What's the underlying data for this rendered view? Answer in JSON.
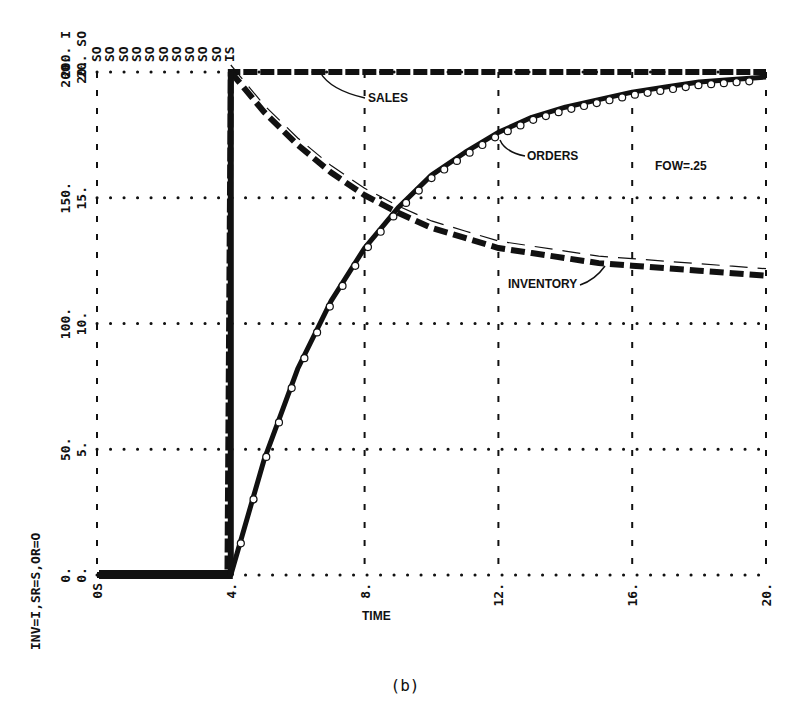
{
  "chart_data": {
    "type": "line",
    "title": "",
    "caption": "(b)",
    "xlabel": "TIME",
    "ylabel_left_rotated": "INV=I,SR=S,OR=O",
    "xlim": [
      0,
      20
    ],
    "ylim": [
      0,
      200
    ],
    "x_ticks": [
      "0S",
      "4.",
      "8.",
      "12.",
      "16.",
      "20."
    ],
    "x_tick_values": [
      0,
      4,
      8,
      12,
      16,
      20
    ],
    "y_ticks_outer": [
      "0.",
      "50.",
      "100.",
      "150.",
      "200."
    ],
    "y_ticks_inner": [
      "0.",
      "5.",
      "10.",
      "15.",
      "20."
    ],
    "y_tick_values": [
      0,
      50,
      100,
      150,
      200
    ],
    "top_plot_symbols": "SO SO SO SO SO SO SO SO SO SO IS",
    "top_left_scale": [
      "200. I",
      "20. SO"
    ],
    "grid": true,
    "grid_style": "dotted",
    "annotations": [
      {
        "text": "SALES",
        "x": 8.1,
        "y": 186
      },
      {
        "text": "ORDERS",
        "x": 12.0,
        "y": 166
      },
      {
        "text": "INVENTORY",
        "x": 11.6,
        "y": 115
      },
      {
        "text": "FOW=.25",
        "x": 16.9,
        "y": 163
      }
    ],
    "x": [
      0,
      2,
      3.9,
      4,
      5,
      6,
      7,
      8,
      9,
      10,
      11,
      12,
      13,
      14,
      15,
      16,
      17,
      18,
      19,
      20
    ],
    "series": [
      {
        "name": "SALES",
        "style": "heavy-dashed",
        "values": [
          0,
          0,
          0,
          200,
          200,
          200,
          200,
          200,
          200,
          200,
          200,
          200,
          200,
          200,
          200,
          200,
          200,
          200,
          200,
          200
        ]
      },
      {
        "name": "ORDERS",
        "style": "solid-with-circles",
        "values": [
          0,
          0,
          0,
          0,
          46,
          82,
          109,
          130,
          146,
          159,
          168,
          176,
          182,
          186,
          189,
          192,
          194,
          196,
          197,
          198
        ]
      },
      {
        "name": "INVENTORY",
        "style": "heavy-dashed",
        "values": [
          0,
          0,
          0,
          200,
          184,
          171,
          160,
          151,
          144,
          138,
          134,
          130,
          128,
          126,
          124,
          123,
          122,
          121,
          120,
          119
        ]
      }
    ]
  },
  "legend_labels": {
    "sales": "SALES",
    "orders": "ORDERS",
    "inventory": "INVENTORY",
    "param": "FOW=.25"
  }
}
